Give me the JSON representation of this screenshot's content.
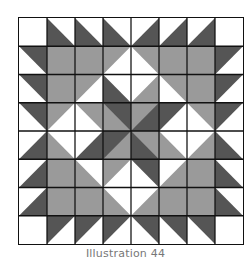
{
  "caption": "Illustration 44",
  "colors": {
    "white": "#ffffff",
    "gray": "#9a9a9a",
    "dark": "#555555",
    "grid": "#111111"
  },
  "grid": {
    "rows": 8,
    "cols": 8,
    "cell_legend": "W=white, G=full gray, or {color}-{corner} where corner is the colored half-square triangle (UL/UR/LL/LR) and other half is 'rest' color",
    "cells": [
      [
        "W",
        "D-LL/W",
        "D-LL/W",
        "D-LL/W",
        "D-LR/W",
        "D-LR/W",
        "D-LR/W",
        "W"
      ],
      [
        "D-UR/W",
        "G",
        "G",
        "G-UL/W",
        "G-UR/W",
        "G",
        "G",
        "D-UL/W"
      ],
      [
        "D-UR/W",
        "G",
        "G-UL/W",
        "D-LL/W",
        "G-LR/W",
        "G-UR/W",
        "G",
        "D-UL/W"
      ],
      [
        "D-UR/W",
        "G-UL/W",
        "G-UR/W",
        "D-UR/G",
        "G-UL/D",
        "D-UL/W",
        "G-UR/W",
        "D-UL/W"
      ],
      [
        "D-LR/W",
        "G-LL/W",
        "D-LR/W",
        "D-UL/G",
        "D-LL/G",
        "G-LL/W",
        "G-LR/W",
        "D-LL/W"
      ],
      [
        "D-LR/W",
        "G",
        "G-LL/W",
        "G-UL/W",
        "D-UR/W",
        "G-LR/W",
        "G",
        "D-LL/W"
      ],
      [
        "D-LR/W",
        "G",
        "G",
        "G-LL/W",
        "G-LR/W",
        "G",
        "G",
        "D-LL/W"
      ],
      [
        "W",
        "D-UL/W",
        "D-UL/W",
        "D-UL/W",
        "D-UR/W",
        "D-UR/W",
        "D-UR/W",
        "W"
      ]
    ]
  }
}
